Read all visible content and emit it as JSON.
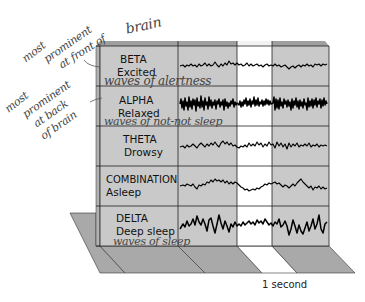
{
  "diagram": {
    "colors": {
      "panel_gray": "#c9c9c9",
      "panel_white": "#ffffff",
      "floor_gray": "#a9a9a9",
      "top_edge": "#9f9f9f",
      "side_face": "#b3b3b3",
      "grid_line": "#222222",
      "handwriting": "#555555"
    },
    "rows": [
      {
        "name": "BETA",
        "state": "Excited",
        "annotation": "waves of alertness",
        "wave_style": "low-amplitude fast"
      },
      {
        "name": "ALPHA",
        "state": "Relaxed",
        "annotation": "waves of not-not sleep",
        "wave_style": "high-amplitude dense"
      },
      {
        "name": "THETA",
        "state": "Drowsy",
        "annotation": "",
        "wave_style": "medium irregular"
      },
      {
        "name": "COMBINATION",
        "state": "Asleep",
        "annotation": "",
        "wave_style": "slow mixed"
      },
      {
        "name": "DELTA",
        "state": "Deep sleep",
        "annotation": "waves of sleep",
        "wave_style": "large slow spikes"
      }
    ],
    "side_notes": [
      {
        "text_lines": [
          "most",
          "prominent",
          "at front of",
          "brain"
        ],
        "points_to": "BETA"
      },
      {
        "text_lines": [
          "most",
          "prominent",
          "at back",
          "of brain"
        ],
        "points_to": "ALPHA"
      }
    ],
    "time_scale": {
      "label": "1 second",
      "highlighted_column": "white band"
    }
  }
}
